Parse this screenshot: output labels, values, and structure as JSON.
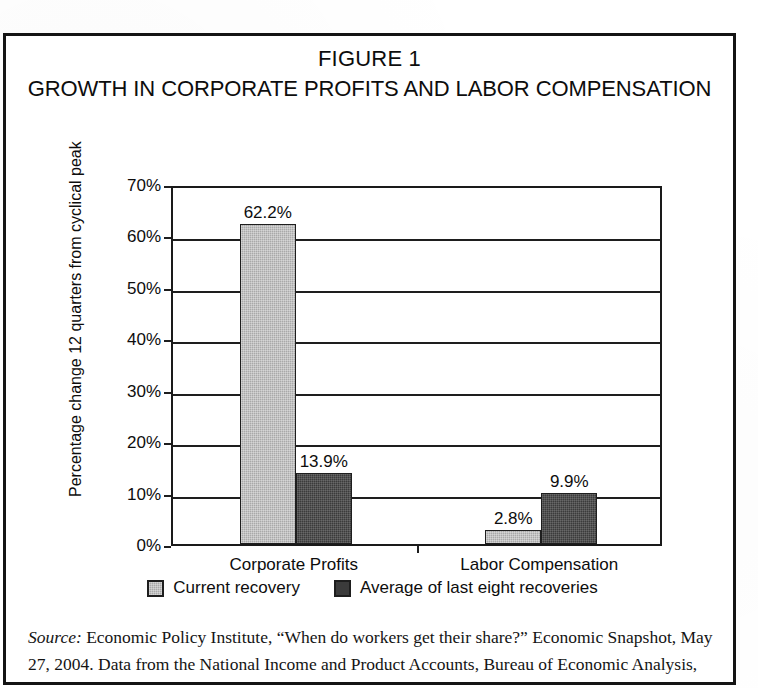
{
  "figure": {
    "title_line1": "FIGURE 1",
    "title_line2": "GROWTH IN CORPORATE PROFITS AND LABOR COMPENSATION"
  },
  "source": {
    "label": "Source:",
    "line1": " Economic Policy Institute, “When do workers get their share?” Economic Snapshot, May",
    "line2": "27, 2004. Data from the National Income and Product Accounts, Bureau of Economic Analysis,"
  },
  "chart_data": {
    "type": "bar",
    "title": "GROWTH IN CORPORATE PROFITS AND LABOR COMPENSATION",
    "subtitle": "FIGURE 1",
    "xlabel": "",
    "ylabel": "Percentage change 12 quarters from cyclical peak",
    "ylim": [
      0,
      70
    ],
    "ytick_labels": [
      "0%",
      "10%",
      "20%",
      "30%",
      "40%",
      "50%",
      "60%",
      "70%"
    ],
    "ytick_values": [
      0,
      10,
      20,
      30,
      40,
      50,
      60,
      70
    ],
    "grid": true,
    "legend_position": "bottom",
    "categories": [
      "Corporate Profits",
      "Labor Compensation"
    ],
    "series": [
      {
        "name": "Current recovery",
        "color": "#a9a9a9",
        "values": [
          62.2,
          2.8
        ],
        "labels": [
          "62.2%",
          "2.8%"
        ]
      },
      {
        "name": "Average of last eight recoveries",
        "color": "#3b3b3b",
        "values": [
          13.9,
          9.9
        ],
        "labels": [
          "13.9%",
          "9.9%"
        ]
      }
    ]
  }
}
